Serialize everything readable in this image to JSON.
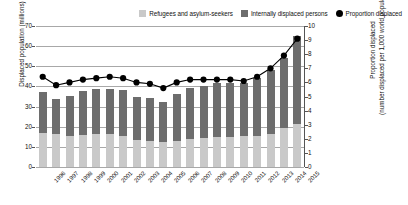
{
  "legend": {
    "items": [
      {
        "label": "Refugees and asylum-seekers",
        "marker": "square-swatch-light",
        "color": "#c9c9c9"
      },
      {
        "label": "Internally displaced persons",
        "marker": "square-swatch-dark",
        "color": "#6d6d6d"
      },
      {
        "label": "Proportion displaced",
        "marker": "circle-marker-black",
        "color": "#000000"
      }
    ]
  },
  "axes": {
    "left_title": "Displaced population (millions)",
    "right_title_line1": "Proportion displaced",
    "right_title_line2": "(number displaced per 1,000 world population)",
    "left_ticks": [
      "0",
      "10",
      "20",
      "30",
      "40",
      "50",
      "60",
      "70"
    ],
    "right_ticks": [
      "0",
      "1",
      "2",
      "3",
      "4",
      "5",
      "6",
      "7",
      "8",
      "9",
      "10"
    ]
  },
  "chart_data": {
    "type": "bar",
    "title": "",
    "xlabel": "",
    "ylabel": "Displaced population (millions)",
    "y2label": "Proportion displaced (number displaced per 1,000 world population)",
    "ylim": [
      0,
      70
    ],
    "y2lim": [
      0,
      10
    ],
    "grid": true,
    "legend_position": "top-right",
    "categories": [
      "1996",
      "1997",
      "1998",
      "1999",
      "2000",
      "2001",
      "2002",
      "2003",
      "2004",
      "2005",
      "2006",
      "2007",
      "2008",
      "2009",
      "2010",
      "2011",
      "2012",
      "2013",
      "2014",
      "2015"
    ],
    "series": [
      {
        "name": "Refugees and asylum-seekers",
        "type": "bar",
        "stack": "displaced",
        "color": "#c9c9c9",
        "axis": "left",
        "values": [
          17.0,
          16.2,
          15.5,
          16.0,
          16.5,
          16.3,
          15.2,
          13.5,
          13.0,
          12.5,
          13.0,
          14.0,
          14.5,
          15.0,
          15.0,
          15.2,
          15.5,
          16.5,
          19.5,
          21.3
        ]
      },
      {
        "name": "Internally displaced persons",
        "type": "bar",
        "stack": "displaced",
        "color": "#6d6d6d",
        "axis": "left",
        "values": [
          20.0,
          17.8,
          20.0,
          21.5,
          22.0,
          22.5,
          22.8,
          21.5,
          21.5,
          20.0,
          23.5,
          25.0,
          25.5,
          26.5,
          26.5,
          26.3,
          28.5,
          31.5,
          34.5,
          43.7
        ]
      },
      {
        "name": "Proportion displaced",
        "type": "line",
        "color": "#000000",
        "axis": "right",
        "values": [
          6.4,
          5.8,
          6.0,
          6.2,
          6.3,
          6.4,
          6.3,
          6.0,
          5.9,
          5.6,
          6.0,
          6.2,
          6.2,
          6.2,
          6.2,
          6.1,
          6.4,
          7.0,
          7.9,
          9.1
        ]
      }
    ]
  }
}
